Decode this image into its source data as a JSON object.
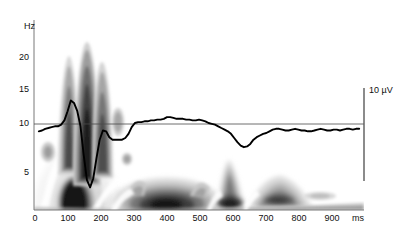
{
  "figure": {
    "type": "time-frequency-spectrogram-with-erp-overlay",
    "background": "#ffffff",
    "trace_color": "#000000",
    "axis_color": "#555555"
  },
  "axes": {
    "y_unit_label": "Hz",
    "y_ticks": [
      "20",
      "15",
      "10",
      "5"
    ],
    "y_tick_values": [
      20,
      15,
      10,
      5
    ],
    "y_range": [
      0.8,
      23.5
    ],
    "x_ticks": [
      "0",
      "100",
      "200",
      "300",
      "400",
      "500",
      "600",
      "700",
      "800",
      "900"
    ],
    "x_tick_values": [
      0,
      100,
      200,
      300,
      400,
      500,
      600,
      700,
      800,
      900
    ],
    "x_unit_label": "ms",
    "x_range": [
      -15,
      1015
    ]
  },
  "scalebar": {
    "label": "10 µV",
    "time_ms": 1000,
    "color": "#555555"
  },
  "chart_data": {
    "type": "heatmap",
    "title": "",
    "xlabel": "ms",
    "ylabel": "Hz",
    "xlim": [
      -15,
      1015
    ],
    "ylim": [
      0.8,
      23.5
    ],
    "grid": false,
    "legend": "none",
    "colormap": [
      "#ffffff",
      "#d9d9d9",
      "#b0b0b0",
      "#8a8a8a",
      "#5e5e5e",
      "#3a3a3a",
      "#1a1a1a"
    ],
    "annotations": [
      "10 µV"
    ],
    "series": [
      {
        "name": "ERP waveform (µV, baseline at 10 Hz axis line)",
        "type": "line",
        "x": [
          0,
          10,
          20,
          30,
          40,
          50,
          60,
          70,
          80,
          90,
          100,
          110,
          120,
          130,
          140,
          150,
          160,
          170,
          180,
          190,
          200,
          210,
          220,
          230,
          240,
          250,
          260,
          270,
          280,
          290,
          300,
          310,
          320,
          330,
          340,
          350,
          360,
          370,
          380,
          390,
          400,
          410,
          420,
          430,
          440,
          450,
          460,
          470,
          480,
          490,
          500,
          510,
          520,
          530,
          540,
          550,
          560,
          570,
          580,
          590,
          600,
          610,
          620,
          630,
          640,
          650,
          660,
          670,
          680,
          690,
          700,
          710,
          720,
          730,
          740,
          750,
          760,
          770,
          780,
          790,
          800,
          810,
          820,
          830,
          840,
          850,
          860,
          870,
          880,
          890,
          900,
          910,
          920,
          930,
          940,
          950,
          960,
          970,
          980,
          990,
          1000
        ],
        "y": [
          10.2,
          10.3,
          10.5,
          10.6,
          10.7,
          10.8,
          10.8,
          11.0,
          11.5,
          12.6,
          13.9,
          13.6,
          12.6,
          10.8,
          7.4,
          4.4,
          3.5,
          4.6,
          7.0,
          9.2,
          10.3,
          10.2,
          9.5,
          9.2,
          9.2,
          9.2,
          9.2,
          9.4,
          9.9,
          10.7,
          11.2,
          11.3,
          11.3,
          11.4,
          11.4,
          11.5,
          11.5,
          11.6,
          11.6,
          11.7,
          11.9,
          11.9,
          11.8,
          11.7,
          11.7,
          11.7,
          11.6,
          11.6,
          11.5,
          11.5,
          11.6,
          11.5,
          11.4,
          11.2,
          11.1,
          11.0,
          10.8,
          10.6,
          10.4,
          10.2,
          9.9,
          9.4,
          8.9,
          8.5,
          8.3,
          8.4,
          8.7,
          9.2,
          9.5,
          9.7,
          9.9,
          10.0,
          10.2,
          10.4,
          10.5,
          10.5,
          10.4,
          10.3,
          10.3,
          10.4,
          10.5,
          10.4,
          10.3,
          10.3,
          10.2,
          10.2,
          10.3,
          10.4,
          10.5,
          10.4,
          10.3,
          10.3,
          10.4,
          10.4,
          10.3,
          10.4,
          10.5,
          10.5,
          10.4,
          10.5,
          10.5
        ]
      }
    ],
    "blobs": [
      {
        "name": "theta-delta burst 0-250ms low frequency",
        "center_ms": 130,
        "center_hz": 2.2,
        "intensity": "very-high"
      },
      {
        "name": "beta ridge ~100ms",
        "center_ms": 98,
        "center_hz": 16,
        "intensity": "medium"
      },
      {
        "name": "beta ridge ~140ms",
        "center_ms": 140,
        "center_hz": 17,
        "intensity": "high"
      },
      {
        "name": "beta ridge ~185ms",
        "center_ms": 185,
        "center_hz": 15,
        "intensity": "medium"
      },
      {
        "name": "small patch ~240ms 11Hz",
        "center_ms": 240,
        "center_hz": 11,
        "intensity": "low"
      },
      {
        "name": "small patch ~55ms 7Hz",
        "center_ms": 55,
        "center_hz": 7,
        "intensity": "low"
      },
      {
        "name": "delta blob 330-520ms",
        "center_ms": 410,
        "center_hz": 2.4,
        "intensity": "very-high"
      },
      {
        "name": "theta blob ~600-650ms",
        "center_ms": 620,
        "center_hz": 3.2,
        "intensity": "high"
      },
      {
        "name": "trailing blob ~760ms",
        "center_ms": 770,
        "center_hz": 3.2,
        "intensity": "medium"
      },
      {
        "name": "faint patch ~900ms",
        "center_ms": 900,
        "center_hz": 2.6,
        "intensity": "low"
      }
    ]
  }
}
